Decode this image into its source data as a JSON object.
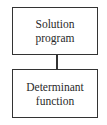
{
  "diagram": {
    "type": "flowchart",
    "nodes": [
      {
        "id": "solution-program",
        "lines": [
          "Solution",
          "program"
        ]
      },
      {
        "id": "determinant-function",
        "lines": [
          "Determinant",
          "function"
        ]
      }
    ],
    "edges": [
      {
        "from": "solution-program",
        "to": "determinant-function",
        "style": "line"
      }
    ]
  }
}
